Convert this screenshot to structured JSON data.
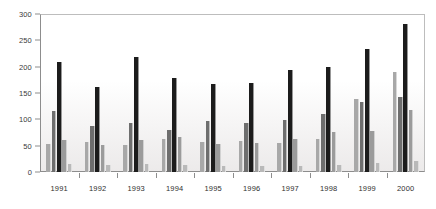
{
  "chart_data": {
    "type": "bar",
    "title": "",
    "subtitle": "",
    "xlabel": "",
    "ylabel": "",
    "categories": [
      "1991",
      "1992",
      "1993",
      "1994",
      "1995",
      "1996",
      "1997",
      "1998",
      "1999",
      "2000"
    ],
    "ylim": [
      0,
      300
    ],
    "yticks": [
      0,
      50,
      100,
      150,
      200,
      250,
      300
    ],
    "ytick_labels": [
      "0",
      "50",
      "100",
      "150",
      "200",
      "250",
      "300"
    ],
    "grid": false,
    "legend": "none",
    "series": [
      {
        "name": "series-1",
        "color": "#a8a8a8",
        "values": [
          54,
          57,
          52,
          62,
          57,
          58,
          56,
          62,
          138,
          190
        ]
      },
      {
        "name": "series-2",
        "color": "#6e6e6e",
        "values": [
          116,
          87,
          94,
          80,
          97,
          93,
          98,
          110,
          133,
          142
        ]
      },
      {
        "name": "series-3",
        "color": "#1c1c1c",
        "values": [
          208,
          162,
          219,
          178,
          167,
          169,
          194,
          199,
          234,
          281
        ]
      },
      {
        "name": "series-4",
        "color": "#9b9b9b",
        "values": [
          60,
          51,
          60,
          66,
          53,
          55,
          62,
          76,
          78,
          118
        ]
      },
      {
        "name": "series-5",
        "color": "#b9b9b9",
        "values": [
          16,
          14,
          15,
          14,
          11,
          11,
          12,
          14,
          17,
          20
        ]
      }
    ]
  },
  "colors": {
    "background": "#ffffff",
    "axis": "#8d8d8d",
    "tick_text": "#2f2f2f",
    "plot_top": "#ffffff",
    "plot_bottom": "#eceaea"
  }
}
